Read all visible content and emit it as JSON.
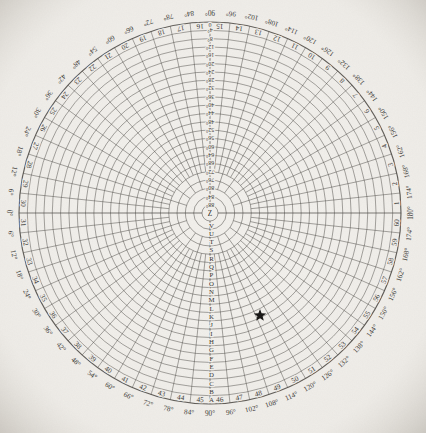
{
  "page": {
    "paper_color": "#f2f0ec",
    "ink_color": "#3d3a36",
    "text_color": "#2b2926"
  },
  "chart_data": {
    "type": "polar_grid",
    "title": "",
    "geometry": {
      "cx": 210,
      "cy": 213,
      "outer_radius": 191,
      "ring_count": 22,
      "ring_step_deg": 4,
      "sector_count": 60,
      "sector_step_deg": 6,
      "all_spokes_to_ring": 18,
      "every_18deg_spokes_to_ring": 20,
      "axis_spokes_to_ring": 22
    },
    "sector_numbers": [
      "1",
      "2",
      "3",
      "4",
      "5",
      "6",
      "7",
      "8",
      "9",
      "10",
      "11",
      "12",
      "13",
      "14",
      "15",
      "16",
      "17",
      "18",
      "19",
      "20",
      "21",
      "22",
      "23",
      "24",
      "25",
      "26",
      "27",
      "28",
      "29",
      "30",
      "31",
      "32",
      "33",
      "34",
      "35",
      "36",
      "37",
      "38",
      "39",
      "40",
      "41",
      "42",
      "43",
      "44",
      "45",
      "46",
      "47",
      "48",
      "49",
      "50",
      "51",
      "52",
      "53",
      "54",
      "55",
      "56",
      "57",
      "58",
      "59",
      "60"
    ],
    "rim_degree_labels": {
      "left": "0°",
      "right": "180°",
      "top_half": [
        "6°",
        "12°",
        "18°",
        "24°",
        "30°",
        "36°",
        "42°",
        "48°",
        "54°",
        "60°",
        "66°",
        "72°",
        "78°",
        "84°",
        "90°",
        "96°",
        "102°",
        "108°",
        "114°",
        "120°",
        "126°",
        "132°",
        "138°",
        "144°",
        "150°",
        "156°",
        "162°",
        "168°",
        "174°"
      ],
      "bottom_half": [
        "6°",
        "12°",
        "18°",
        "24°",
        "30°",
        "36°",
        "42°",
        "48°",
        "54°",
        "60°",
        "66°",
        "72°",
        "78°",
        "84°",
        "90°",
        "96°",
        "102°",
        "108°",
        "114°",
        "120°",
        "126°",
        "132°",
        "138°",
        "144°",
        "150°",
        "156°",
        "162°",
        "168°",
        "174°"
      ]
    },
    "ring_scale_labels_top": [
      "0",
      "4°",
      "8°",
      "12°",
      "16°",
      "20°",
      "24°",
      "28°",
      "32°",
      "36°",
      "40°",
      "44°",
      "48°",
      "52°",
      "56°",
      "60°",
      "64°",
      "68°",
      "72°",
      "76°",
      "80°",
      "84°",
      "88°"
    ],
    "ring_band_letters_bottom": [
      "A",
      "B",
      "C",
      "D",
      "E",
      "F",
      "G",
      "H",
      "I",
      "J",
      "K",
      "L",
      "M",
      "N",
      "O",
      "P",
      "Q",
      "R",
      "S",
      "T",
      "U",
      "V"
    ],
    "center_label": "Z",
    "markers": [
      {
        "shape": "star",
        "color": "#0b0a09",
        "angle_deg": 116,
        "radial_deg": 37,
        "size": 13,
        "half": "bottom"
      }
    ]
  }
}
